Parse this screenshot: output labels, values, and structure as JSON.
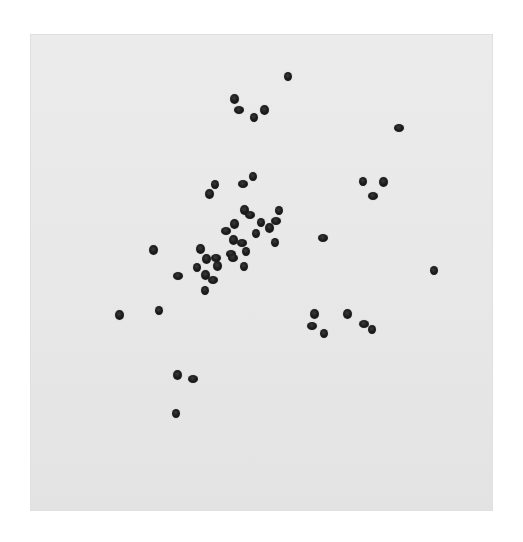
{
  "image": {
    "description": "Photograph of dark round seeds scattered on a light gray square sheet on white background",
    "colors": {
      "background": "#ffffff",
      "sheet": "#e8e8e8",
      "seed": "#1a1a1a"
    },
    "sheet": {
      "x": 30,
      "y": 34,
      "width": 463,
      "height": 477
    },
    "seed_count": 58,
    "seeds": [
      {
        "x": 288,
        "y": 76
      },
      {
        "x": 234,
        "y": 99
      },
      {
        "x": 239,
        "y": 110
      },
      {
        "x": 254,
        "y": 117
      },
      {
        "x": 264,
        "y": 110
      },
      {
        "x": 399,
        "y": 128
      },
      {
        "x": 363,
        "y": 181
      },
      {
        "x": 383,
        "y": 182
      },
      {
        "x": 373,
        "y": 196
      },
      {
        "x": 215,
        "y": 184
      },
      {
        "x": 209,
        "y": 194
      },
      {
        "x": 243,
        "y": 184
      },
      {
        "x": 253,
        "y": 176
      },
      {
        "x": 244,
        "y": 210
      },
      {
        "x": 250,
        "y": 215
      },
      {
        "x": 279,
        "y": 210
      },
      {
        "x": 234,
        "y": 224
      },
      {
        "x": 226,
        "y": 231
      },
      {
        "x": 261,
        "y": 222
      },
      {
        "x": 269,
        "y": 228
      },
      {
        "x": 276,
        "y": 221
      },
      {
        "x": 256,
        "y": 233
      },
      {
        "x": 233,
        "y": 240
      },
      {
        "x": 242,
        "y": 243
      },
      {
        "x": 275,
        "y": 242
      },
      {
        "x": 200,
        "y": 249
      },
      {
        "x": 231,
        "y": 254
      },
      {
        "x": 246,
        "y": 251
      },
      {
        "x": 206,
        "y": 259
      },
      {
        "x": 216,
        "y": 258
      },
      {
        "x": 197,
        "y": 267
      },
      {
        "x": 217,
        "y": 266
      },
      {
        "x": 233,
        "y": 258
      },
      {
        "x": 244,
        "y": 266
      },
      {
        "x": 205,
        "y": 275
      },
      {
        "x": 213,
        "y": 280
      },
      {
        "x": 205,
        "y": 290
      },
      {
        "x": 153,
        "y": 250
      },
      {
        "x": 178,
        "y": 276
      },
      {
        "x": 159,
        "y": 310
      },
      {
        "x": 119,
        "y": 315
      },
      {
        "x": 323,
        "y": 238
      },
      {
        "x": 434,
        "y": 270
      },
      {
        "x": 314,
        "y": 314
      },
      {
        "x": 312,
        "y": 326
      },
      {
        "x": 324,
        "y": 333
      },
      {
        "x": 347,
        "y": 314
      },
      {
        "x": 364,
        "y": 324
      },
      {
        "x": 372,
        "y": 329
      },
      {
        "x": 177,
        "y": 375
      },
      {
        "x": 193,
        "y": 379
      },
      {
        "x": 176,
        "y": 413
      }
    ]
  }
}
